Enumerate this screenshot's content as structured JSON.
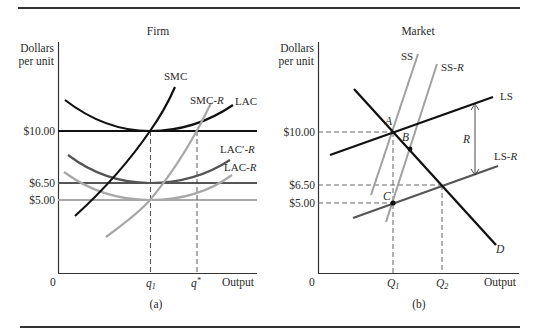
{
  "colors": {
    "black": "#111111",
    "dark_gray": "#555555",
    "mid_gray": "#777777",
    "light_gray": "#a8a8a8",
    "rule": "#333333",
    "text": "#2a2a2a"
  },
  "panel_a": {
    "title": "Firm",
    "y_axis_label_line1": "Dollars",
    "y_axis_label_line2": "per unit",
    "origin": "0",
    "x_axis_label": "Output",
    "caption": "(a)",
    "y_ticks": [
      "$10.00",
      "$6.50",
      "$5.00"
    ],
    "x_ticks": {
      "q1_base": "q",
      "q1_sub": "1",
      "qstar_base": "q",
      "qstar_sup": "*"
    },
    "curve_labels": {
      "smc": "SMC",
      "smc_r_base": "SMC-",
      "smc_r_it": "R",
      "lac": "LAC",
      "lac_prime_r_base": "LAC′-",
      "lac_prime_r_it": "R",
      "lac_r_base": "LAC-",
      "lac_r_it": "R"
    }
  },
  "panel_b": {
    "title": "Market",
    "y_axis_label_line1": "Dollars",
    "y_axis_label_line2": "per unit",
    "origin": "0",
    "x_axis_label": "Output",
    "caption": "(b)",
    "y_ticks": [
      "$10.00",
      "$6.50",
      "$5.00"
    ],
    "x_ticks": {
      "Q1_base": "Q",
      "Q1_sub": "1",
      "Q2_base": "Q",
      "Q2_sub": "2"
    },
    "curve_labels": {
      "ss": "SS",
      "ss_r_base": "SS-",
      "ss_r_it": "R",
      "ls": "LS",
      "ls_r_base": "LS-",
      "ls_r_it": "R",
      "d": "D"
    },
    "points": {
      "a": "A",
      "b": "B",
      "c": "C"
    },
    "rent_label": "R"
  }
}
